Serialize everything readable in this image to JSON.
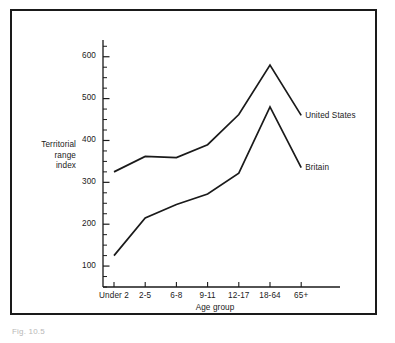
{
  "chart_data": {
    "type": "line",
    "title": "",
    "xlabel": "Age group",
    "ylabel": "Territorial range index",
    "ylabel_lines": [
      "Territorial",
      "range",
      "index"
    ],
    "categories": [
      "Under 2",
      "2-5",
      "6-8",
      "9-11",
      "12-17",
      "18-64",
      "65+"
    ],
    "ylim": [
      50,
      640
    ],
    "yticks": [
      100,
      200,
      300,
      400,
      500,
      600
    ],
    "ytick_labels": [
      "100",
      "200",
      "300",
      "400",
      "500",
      "600"
    ],
    "minor_tick_step": 25,
    "grid": false,
    "legend_position": "inline-right-of-line-ends",
    "series": [
      {
        "name": "United States",
        "label": "United States",
        "color": "#1a1a1a",
        "values": [
          325,
          362,
          359,
          390,
          462,
          580,
          460
        ]
      },
      {
        "name": "Britain",
        "label": "Britain",
        "color": "#1a1a1a",
        "values": [
          125,
          215,
          247,
          272,
          322,
          480,
          335
        ]
      }
    ]
  },
  "figure": {
    "caption": "Fig. 10.5"
  }
}
